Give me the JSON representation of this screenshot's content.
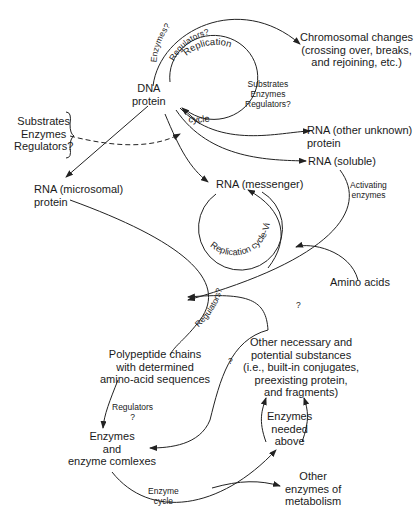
{
  "nodes": {
    "dna": [
      "DNA",
      "protein"
    ],
    "chromosomal": [
      "Chromosomal changes",
      "(crossing over, breaks,",
      "and rejoining, etc.)"
    ],
    "substrates_left": [
      "Substrates",
      "Enzymes",
      "Regulators?"
    ],
    "substrates_right": [
      "Substrates",
      "Enzymes",
      "Regulators?"
    ],
    "rna_other": [
      "RNA (other unknown)",
      "protein"
    ],
    "rna_soluble": "RNA (soluble)",
    "rna_microsomal": [
      "RNA (microsomal)",
      "protein"
    ],
    "rna_messenger": "RNA (messenger)",
    "activating": [
      "Activating",
      "enzymes"
    ],
    "amino_acids": "Amino acids",
    "other_substances": [
      "Other necessary and",
      "potential substances",
      "(i.e., built-in conjugates,",
      "preexisting protein,",
      "and fragments)"
    ],
    "polypeptide": [
      "Polypeptide chains",
      "with determined",
      "amino-acid sequences"
    ],
    "regulators_q": [
      "Regulators",
      "?"
    ],
    "enzymes_complexes": [
      "Enzymes",
      "and",
      "enzyme comlexes"
    ],
    "enzymes_needed": [
      "Enzymes",
      "needed",
      "above"
    ],
    "other_enzymes": [
      "Other",
      "enzymes of",
      "metabolism"
    ],
    "enzyme_cycle": [
      "Enzyme",
      "cycle"
    ]
  },
  "edge_labels": {
    "enzymes_q": "Enzymes?",
    "regulators_q_top": "Regulators?",
    "replication": "Replication",
    "cycle": "cycle",
    "replication_virus": "Replication cycle-Virus",
    "regulators_curve": "Regulators?",
    "q1": "?",
    "q2": "?"
  }
}
